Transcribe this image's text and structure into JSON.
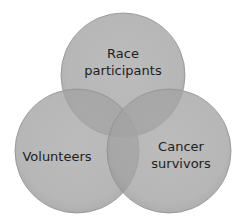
{
  "diagram": {
    "type": "venn",
    "sets": [
      {
        "id": "race",
        "line1": "Race",
        "line2": "participants",
        "cx": 123,
        "cy": 75,
        "r": 62,
        "label_x": 123,
        "label_y": 62
      },
      {
        "id": "volunteers",
        "line1": "Volunteers",
        "line2": "",
        "cx": 77,
        "cy": 151,
        "r": 62,
        "label_x": 57,
        "label_y": 156
      },
      {
        "id": "cancer",
        "line1": "Cancer",
        "line2": "survivors",
        "cx": 169,
        "cy": 151,
        "r": 62,
        "label_x": 181,
        "label_y": 155
      }
    ],
    "colors": {
      "fill": "#9a9a9a",
      "fill_opacity": "0.78",
      "edge": "#8a8a8a",
      "text": "#1e1e1e",
      "background": "#ffffff"
    }
  }
}
